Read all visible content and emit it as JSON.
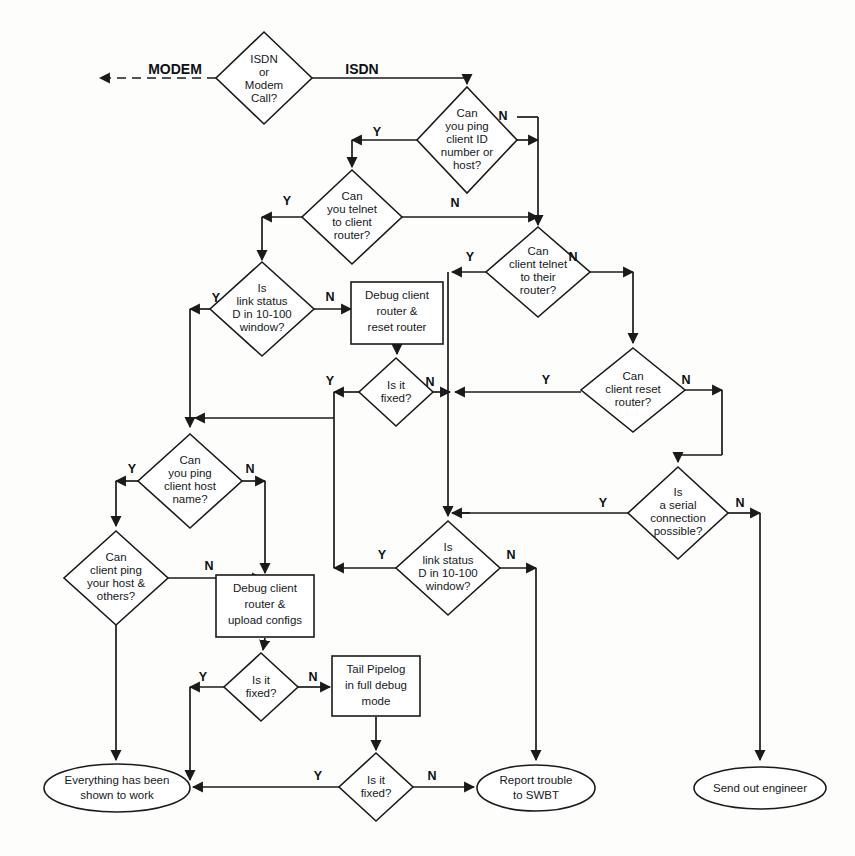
{
  "diagram": {
    "canvas": {
      "width": 855,
      "height": 856
    },
    "colors": {
      "stroke": "#1a1a1a",
      "fill": "#ffffff",
      "text": "#15191c",
      "background": "#fdfdfc"
    }
  },
  "nodes": {
    "isdn_or_modem": {
      "label": "ISDN\nor\nModem\nCall?",
      "shape": "decision",
      "cx": 264,
      "cy": 78,
      "w": 96,
      "h": 92
    },
    "ping_client_id": {
      "label": "Can\nyou ping\nclient ID\nnumber or\nhost?",
      "shape": "decision",
      "cx": 467,
      "cy": 140,
      "w": 100,
      "h": 106
    },
    "telnet_client_router": {
      "label": "Can\nyou telnet\nto client\nrouter?",
      "shape": "decision",
      "cx": 352,
      "cy": 217,
      "w": 100,
      "h": 94
    },
    "client_telnet_router": {
      "label": "Can\nclient telnet\nto their\nrouter?",
      "shape": "decision",
      "cx": 538,
      "cy": 272,
      "w": 104,
      "h": 90
    },
    "link_status_top": {
      "label": "Is\nlink status\nD in 10-100\nwindow?",
      "shape": "decision",
      "cx": 262,
      "cy": 309,
      "w": 104,
      "h": 94
    },
    "debug_reset_router": {
      "label": "Debug client\nrouter &\nreset router",
      "shape": "process",
      "cx": 397,
      "cy": 313,
      "w": 92,
      "h": 62
    },
    "client_reset_router": {
      "label": "Can\nclient reset\nrouter?",
      "shape": "decision",
      "cx": 633,
      "cy": 390,
      "w": 104,
      "h": 84
    },
    "is_it_fixed_1": {
      "label": "Is it\nfixed?",
      "shape": "decision",
      "cx": 396,
      "cy": 392,
      "w": 74,
      "h": 62
    },
    "serial_connection": {
      "label": "Is\na serial\nconnection\npossible?",
      "shape": "decision",
      "cx": 678,
      "cy": 513,
      "w": 100,
      "h": 92
    },
    "ping_client_host": {
      "label": "Can\nyou ping\nclient  host\nname?",
      "shape": "decision",
      "cx": 190,
      "cy": 481,
      "w": 104,
      "h": 94
    },
    "client_ping_host": {
      "label": "Can\nclient ping\nyour host &\nothers?",
      "shape": "decision",
      "cx": 116,
      "cy": 578,
      "w": 104,
      "h": 94
    },
    "link_status_bottom": {
      "label": "Is\nlink status\nD in 10-100\nwindow?",
      "shape": "decision",
      "cx": 448,
      "cy": 568,
      "w": 104,
      "h": 94
    },
    "debug_upload_configs": {
      "label": "Debug client\nrouter &\nupload configs",
      "shape": "process",
      "cx": 265,
      "cy": 606,
      "w": 98,
      "h": 62
    },
    "is_it_fixed_2": {
      "label": "Is it\nfixed?",
      "shape": "decision",
      "cx": 261,
      "cy": 687,
      "w": 74,
      "h": 62
    },
    "tail_pipelog": {
      "label": "Tail Pipelog\nin full debug\nmode",
      "shape": "process",
      "cx": 376,
      "cy": 686,
      "w": 88,
      "h": 60
    },
    "is_it_fixed_3": {
      "label": "Is it\nfixed?",
      "shape": "decision",
      "cx": 376,
      "cy": 787,
      "w": 74,
      "h": 62
    },
    "everything_works": {
      "label": "Everything has been\nshown to work",
      "shape": "terminator",
      "cx": 117,
      "cy": 788,
      "w": 146,
      "h": 48
    },
    "report_trouble": {
      "label": "Report trouble\nto SWBT",
      "shape": "terminator",
      "cx": 536,
      "cy": 788,
      "w": 118,
      "h": 46
    },
    "send_out_engineer": {
      "label": "Send out engineer",
      "shape": "terminator",
      "cx": 760,
      "cy": 788,
      "w": 132,
      "h": 42
    }
  },
  "edge_labels": {
    "modem": "MODEM",
    "isdn": "ISDN",
    "ping_client_id_yes": "Y",
    "ping_client_id_no": "N",
    "telnet_client_router_yes": "Y",
    "telnet_client_router_no": "N",
    "client_telnet_yes": "Y",
    "client_telnet_no": "N",
    "link_status_top_yes": "Y",
    "link_status_top_no": "N",
    "is_it_fixed_1_yes": "Y",
    "is_it_fixed_1_no": "N",
    "client_reset_yes": "Y",
    "client_reset_no": "N",
    "serial_yes": "Y",
    "serial_no": "N",
    "ping_client_host_yes": "Y",
    "ping_client_host_no": "N",
    "client_ping_host_no": "N",
    "link_status_bottom_yes": "Y",
    "link_status_bottom_no": "N",
    "is_it_fixed_2_yes": "Y",
    "is_it_fixed_2_no": "N",
    "is_it_fixed_3_yes": "Y",
    "is_it_fixed_3_no": "N"
  },
  "label_positions": {
    "modem": {
      "x": 175,
      "y": 70
    },
    "isdn": {
      "x": 362,
      "y": 70
    },
    "ping_client_id_yes": {
      "x": 377,
      "y": 133
    },
    "ping_client_id_no": {
      "x": 503,
      "y": 117
    },
    "telnet_client_router_yes": {
      "x": 287,
      "y": 202
    },
    "telnet_client_router_no": {
      "x": 455,
      "y": 204
    },
    "client_telnet_yes": {
      "x": 470,
      "y": 258
    },
    "client_telnet_no": {
      "x": 573,
      "y": 258
    },
    "link_status_top_yes": {
      "x": 216,
      "y": 299
    },
    "link_status_top_no": {
      "x": 330,
      "y": 298
    },
    "is_it_fixed_1_yes": {
      "x": 330,
      "y": 382
    },
    "is_it_fixed_1_no": {
      "x": 430,
      "y": 383
    },
    "client_reset_yes": {
      "x": 546,
      "y": 381
    },
    "client_reset_no": {
      "x": 686,
      "y": 381
    },
    "serial_yes": {
      "x": 603,
      "y": 504
    },
    "serial_no": {
      "x": 740,
      "y": 504
    },
    "ping_client_host_yes": {
      "x": 132,
      "y": 470
    },
    "ping_client_host_no": {
      "x": 250,
      "y": 470
    },
    "client_ping_host_no": {
      "x": 209,
      "y": 567
    },
    "link_status_bottom_yes": {
      "x": 382,
      "y": 556
    },
    "link_status_bottom_no": {
      "x": 511,
      "y": 556
    },
    "is_it_fixed_2_yes": {
      "x": 203,
      "y": 678
    },
    "is_it_fixed_2_no": {
      "x": 313,
      "y": 678
    },
    "is_it_fixed_3_yes": {
      "x": 318,
      "y": 777
    },
    "is_it_fixed_3_no": {
      "x": 432,
      "y": 777
    }
  }
}
